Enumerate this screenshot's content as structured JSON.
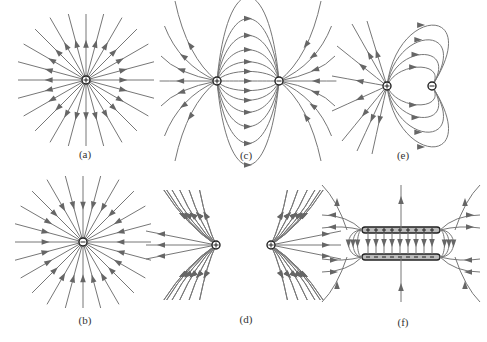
{
  "figure": {
    "panels": [
      {
        "id": "a",
        "label": "(a)",
        "description": "Field lines radiating outward from a single positive charge",
        "charges": [
          "+"
        ]
      },
      {
        "id": "b",
        "label": "(b)",
        "description": "Field lines converging inward to a single negative charge",
        "charges": [
          "-"
        ]
      },
      {
        "id": "c",
        "label": "(c)",
        "description": "Field lines from a positive charge to a negative charge (dipole)",
        "charges": [
          "+",
          "-"
        ]
      },
      {
        "id": "d",
        "label": "(d)",
        "description": "Field lines of two equal positive charges repelling",
        "charges": [
          "+",
          "+"
        ]
      },
      {
        "id": "e",
        "label": "(e)",
        "description": "Field lines between a larger positive charge and a smaller negative charge",
        "charges": [
          "+",
          "-"
        ]
      },
      {
        "id": "f",
        "label": "(f)",
        "description": "Field between two oppositely charged parallel plates",
        "charges": [
          "+ plate",
          "- plate"
        ]
      }
    ]
  },
  "colors": {
    "line": "#777777",
    "charge_outline": "#222222",
    "background": "#ffffff"
  }
}
